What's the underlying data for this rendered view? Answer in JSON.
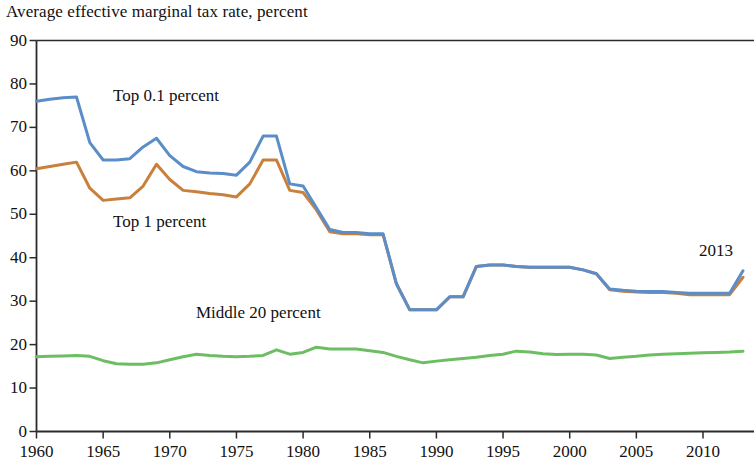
{
  "chart_data": {
    "type": "line",
    "title": "Average effective marginal tax rate, percent",
    "xlabel": "",
    "ylabel": "",
    "xlim": [
      1960,
      2013
    ],
    "ylim": [
      0,
      90
    ],
    "ytick_values": [
      0,
      10,
      20,
      30,
      40,
      50,
      60,
      70,
      80,
      90
    ],
    "ytick_labels": [
      "0",
      "10",
      "20",
      "30",
      "40",
      "50",
      "60",
      "70",
      "80",
      "90"
    ],
    "xtick_values": [
      1960,
      1965,
      1970,
      1975,
      1980,
      1985,
      1990,
      1995,
      2000,
      2005,
      2010
    ],
    "xtick_labels": [
      "1960",
      "1965",
      "1970",
      "1975",
      "1980",
      "1985",
      "1990",
      "1995",
      "2000",
      "2005",
      "2010"
    ],
    "grid": false,
    "legend_position": "inline-labels",
    "annotations": [
      {
        "text": "2013",
        "x": 2011.2,
        "y": 41.5
      }
    ],
    "colors": {
      "top01": "#5B8DC8",
      "top1": "#C8803C",
      "middle20": "#6DBE63",
      "axis": "#2B2B2B"
    },
    "x": [
      1960,
      1961,
      1962,
      1963,
      1964,
      1965,
      1966,
      1967,
      1968,
      1969,
      1970,
      1971,
      1972,
      1973,
      1974,
      1975,
      1976,
      1977,
      1978,
      1979,
      1980,
      1981,
      1982,
      1983,
      1984,
      1985,
      1986,
      1987,
      1988,
      1989,
      1990,
      1991,
      1992,
      1993,
      1994,
      1995,
      1996,
      1997,
      1998,
      1999,
      2000,
      2001,
      2002,
      2003,
      2004,
      2005,
      2006,
      2007,
      2008,
      2009,
      2010,
      2011,
      2012,
      2013
    ],
    "series": [
      {
        "name": "Top 0.1 percent",
        "color": "#5B8DC8",
        "values": [
          76.0,
          76.5,
          76.8,
          77.0,
          66.5,
          62.5,
          62.5,
          62.8,
          65.5,
          67.5,
          63.5,
          61.0,
          59.8,
          59.5,
          59.4,
          59.0,
          62.0,
          68.0,
          68.0,
          57.0,
          56.5,
          51.5,
          46.5,
          45.8,
          45.8,
          45.5,
          45.5,
          34.0,
          28.0,
          28.0,
          28.0,
          31.0,
          31.0,
          38.0,
          38.3,
          38.3,
          38.0,
          37.8,
          37.8,
          37.8,
          37.8,
          37.2,
          36.3,
          32.8,
          32.5,
          32.3,
          32.2,
          32.2,
          32.0,
          31.8,
          31.8,
          31.8,
          31.8,
          37.0
        ]
      },
      {
        "name": "Top 1 percent",
        "color": "#C8803C",
        "values": [
          60.5,
          61.0,
          61.5,
          62.0,
          56.0,
          53.2,
          53.5,
          53.8,
          56.5,
          61.5,
          58.0,
          55.5,
          55.2,
          54.8,
          54.5,
          54.0,
          57.0,
          62.5,
          62.5,
          55.5,
          55.0,
          51.0,
          46.0,
          45.5,
          45.5,
          45.3,
          45.3,
          34.0,
          28.0,
          28.0,
          28.0,
          31.0,
          31.0,
          38.0,
          38.3,
          38.3,
          38.0,
          37.8,
          37.8,
          37.8,
          37.8,
          37.2,
          36.3,
          32.6,
          32.3,
          32.1,
          32.0,
          32.0,
          31.8,
          31.5,
          31.5,
          31.5,
          31.5,
          35.5
        ]
      },
      {
        "name": "Middle 20 percent",
        "color": "#6DBE63",
        "values": [
          17.2,
          17.3,
          17.4,
          17.5,
          17.3,
          16.3,
          15.6,
          15.5,
          15.5,
          15.8,
          16.5,
          17.2,
          17.8,
          17.5,
          17.3,
          17.2,
          17.3,
          17.5,
          18.8,
          17.8,
          18.2,
          19.4,
          19.0,
          19.0,
          19.0,
          18.6,
          18.2,
          17.3,
          16.5,
          15.8,
          16.2,
          16.5,
          16.8,
          17.1,
          17.5,
          17.8,
          18.5,
          18.3,
          17.9,
          17.7,
          17.8,
          17.8,
          17.6,
          16.8,
          17.1,
          17.3,
          17.6,
          17.8,
          17.9,
          18.0,
          18.1,
          18.2,
          18.3,
          18.5
        ]
      }
    ]
  },
  "series_labels": [
    {
      "text": "Top 0.1 percent",
      "left": 113,
      "top": 86
    },
    {
      "text": "Top 1 percent",
      "left": 113,
      "top": 212
    },
    {
      "text": "Middle 20 percent",
      "left": 196,
      "top": 303
    }
  ]
}
